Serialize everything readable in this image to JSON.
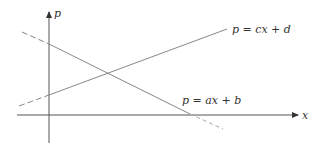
{
  "diagram": {
    "axes": {
      "y_label": "p",
      "x_label": "x",
      "color": "#555555"
    },
    "lines": [
      {
        "id": "demand",
        "label": "p = ax + b",
        "slope": "negative",
        "color": "#888888"
      },
      {
        "id": "supply",
        "label": "p = cx + d",
        "slope": "positive",
        "color": "#888888"
      }
    ]
  }
}
